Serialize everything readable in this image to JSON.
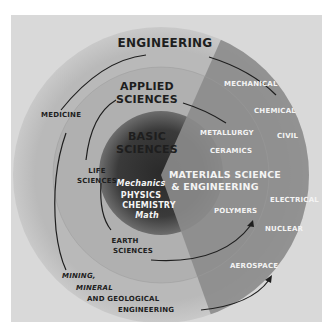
{
  "diagram": {
    "type": "concentric-rings",
    "rings": {
      "outer": "ENGINEERING",
      "middle_line1": "APPLIED",
      "middle_line2": "SCIENCES",
      "inner_line1": "BASIC",
      "inner_line2": "SCIENCES"
    },
    "basic_sciences_items": [
      "Mechanics",
      "PHYSICS",
      "CHEMISTRY",
      "Math"
    ],
    "applied_sciences_items": {
      "life_line1": "LIFE",
      "life_line2": "SCIENCES",
      "earth_line1": "EARTH",
      "earth_line2": "SCIENCES"
    },
    "engineering_items": {
      "medicine": "MEDICINE",
      "mining_line1": "MINING,",
      "mining_line2": "MINERAL",
      "mining_line3": "AND GEOLOGICAL",
      "mining_line4": "ENGINEERING"
    },
    "materials_sector": {
      "title_line1": "MATERIALS SCIENCE",
      "title_line2": "& ENGINEERING",
      "inner_items": [
        "METALLURGY",
        "CERAMICS",
        "POLYMERS"
      ],
      "outer_items": [
        "MECHANICAL",
        "CHEMICAL",
        "CIVIL",
        "ELECTRICAL",
        "NUCLEAR",
        "AEROSPACE"
      ]
    },
    "colors": {
      "background": "#d9d9d9",
      "outer_ring": "#bdbdbd",
      "middle_ring": "#a8a8a8",
      "core": "#3a3a3a",
      "sector": "#8a8a8a",
      "dark_text": "#1e1e1e",
      "light_text": "#f4f4f4"
    }
  }
}
